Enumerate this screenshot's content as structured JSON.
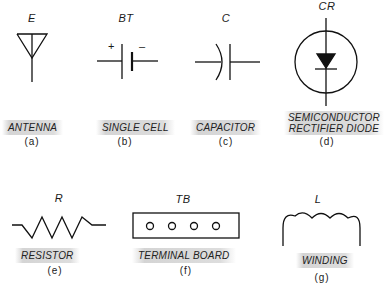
{
  "symbols": [
    {
      "id": "a",
      "designator": "E",
      "name": "ANTENNA",
      "sub": "(a)"
    },
    {
      "id": "b",
      "designator": "BT",
      "name": "SINGLE CELL",
      "sub": "(b)",
      "polarity": {
        "positive": "+",
        "negative": "–"
      }
    },
    {
      "id": "c",
      "designator": "C",
      "name": "CAPACITOR",
      "sub": "(c)"
    },
    {
      "id": "d",
      "designator": "CR",
      "name_line1": "SEMICONDUCTOR",
      "name_line2": "RECTIFIER DIODE",
      "sub": "(d)"
    },
    {
      "id": "e",
      "designator": "R",
      "name": "RESISTOR",
      "sub": "(e)"
    },
    {
      "id": "f",
      "designator": "TB",
      "name": "TERMINAL BOARD",
      "sub": "(f)"
    },
    {
      "id": "g",
      "designator": "L",
      "name": "WINDING",
      "sub": "(g)"
    }
  ]
}
